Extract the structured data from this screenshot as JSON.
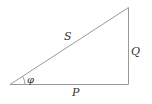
{
  "diagram": {
    "type": "power-triangle",
    "labels": {
      "hypotenuse": "S",
      "vertical": "Q",
      "horizontal": "P",
      "angle": "φ"
    },
    "colors": {
      "line": "#9a9a9a",
      "text": "#333333"
    }
  }
}
